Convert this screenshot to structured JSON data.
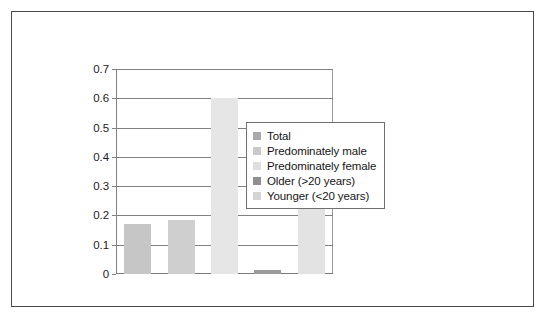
{
  "chart_data": {
    "type": "bar",
    "title": "",
    "xlabel": "",
    "ylabel": "",
    "ylim": [
      0,
      0.7
    ],
    "ytick_labels": [
      "0.7",
      "0.6",
      "0.5",
      "0.4",
      "0.3",
      "0.2",
      "0.1",
      "0"
    ],
    "ytick_values": [
      0.7,
      0.6,
      0.5,
      0.4,
      0.3,
      0.2,
      0.1,
      0
    ],
    "grid": true,
    "xtick_labels": [],
    "legend_position": "right",
    "categories": [
      "Total",
      "Predominately male",
      "Predominately female",
      "Older (>20 years)",
      "Younger (<20 years)"
    ],
    "values": [
      0.17,
      0.185,
      0.6,
      0.015,
      0.41
    ],
    "colors": [
      "#c6c6c6",
      "#cfcfcf",
      "#e6e6e6",
      "#9a9a9a",
      "#e3e3e3"
    ]
  },
  "legend": {
    "items": [
      {
        "label": "Total",
        "color": "#a8a8a8"
      },
      {
        "label": "Predominately male",
        "color": "#c9c9c9"
      },
      {
        "label": "Predominately female",
        "color": "#dedede"
      },
      {
        "label": "Older (>20 years)",
        "color": "#8f8f8f"
      },
      {
        "label": "Younger (<20 years)",
        "color": "#d4d4d4"
      }
    ]
  }
}
